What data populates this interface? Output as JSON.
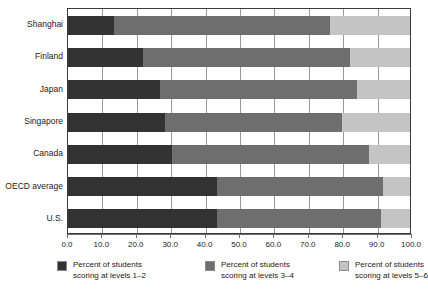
{
  "chart_data": {
    "type": "bar",
    "orientation": "horizontal",
    "stacked": true,
    "title": "",
    "xlabel": "",
    "ylabel": "",
    "xlim": [
      0,
      100
    ],
    "grid": true,
    "legend_position": "bottom",
    "xticks": [
      "0.0",
      "10.0",
      "20.0",
      "30.0",
      "40.0",
      "50.0",
      "60.0",
      "70.0",
      "80.0",
      "90.0",
      "100.0"
    ],
    "xtick_values": [
      0,
      10,
      20,
      30,
      40,
      50,
      60,
      70,
      80,
      90,
      100
    ],
    "categories": [
      "Shanghai",
      "Finland",
      "Japan",
      "Singapore",
      "Canada",
      "OECD average",
      "U.S."
    ],
    "series": [
      {
        "name": "Percent of students scoring at levels 1–2",
        "color": "#333333",
        "values": [
          13.5,
          22.0,
          27.0,
          28.5,
          30.5,
          43.5,
          43.5
        ]
      },
      {
        "name": "Percent of students scoring at levels 3–4",
        "color": "#6e6e6e",
        "values": [
          63.0,
          60.5,
          57.5,
          51.5,
          57.5,
          48.5,
          48.0
        ]
      },
      {
        "name": "Percent of students scoring at levels 5–6",
        "color": "#c4c4c4",
        "values": [
          23.5,
          17.5,
          15.5,
          20.0,
          12.0,
          8.0,
          8.5
        ]
      }
    ],
    "cumulative_boundaries": [
      [
        13.5,
        76.5
      ],
      [
        22.0,
        82.5
      ],
      [
        27.0,
        84.5
      ],
      [
        28.5,
        80.0
      ],
      [
        30.5,
        88.0
      ],
      [
        43.5,
        92.0
      ],
      [
        43.5,
        91.5
      ]
    ]
  },
  "legend": {
    "items": [
      {
        "line1": "Percent of students",
        "line2": "scoring at levels 1–2",
        "color": "#333333"
      },
      {
        "line1": "Percent of students",
        "line2": "scoring at levels 3–4",
        "color": "#6e6e6e"
      },
      {
        "line1": "Percent of students",
        "line2": "scoring at levels 5–6",
        "color": "#c4c4c4"
      }
    ]
  },
  "colors": {
    "level_1_2": "#333333",
    "level_3_4": "#6e6e6e",
    "level_5_6": "#c4c4c4",
    "axis": "#3a3a3a",
    "gridline": "#9a9a9a",
    "background": "#ffffff"
  }
}
